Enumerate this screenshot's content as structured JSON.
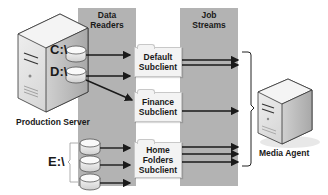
{
  "columns": {
    "data_readers": {
      "title_line1": "Data",
      "title_line2": "Readers"
    },
    "job_streams": {
      "title_line1": "Job",
      "title_line2": "Streams"
    }
  },
  "production_server": {
    "label": "Production Server",
    "drives": [
      {
        "label": "C:\\"
      },
      {
        "label": "D:\\"
      },
      {
        "label": "E:\\"
      }
    ]
  },
  "subclients": [
    {
      "line1": "Default",
      "line2": "Subclient",
      "line3": "",
      "streams": 2
    },
    {
      "line1": "Finance",
      "line2": "Subclient",
      "line3": "",
      "streams": 1
    },
    {
      "line1": "Home",
      "line2": "Folders",
      "line3": "Subclient",
      "streams": 3
    }
  ],
  "media_agent": {
    "label": "Media Agent"
  },
  "colors": {
    "column_gray": "#b3b3b3",
    "folder_fill": "#f3f3f3",
    "arrow": "#1a1a1a",
    "server_light": "#e6e6e6",
    "server_dark": "#bdbdbd"
  }
}
